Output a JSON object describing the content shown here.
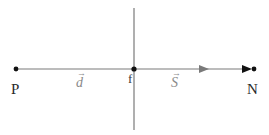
{
  "diagram": {
    "colors": {
      "line": "#7a7a7a",
      "point": "#111111",
      "label_dark": "#2a2a2a",
      "label_vector": "#8a8a8a"
    },
    "points": [
      {
        "id": "P",
        "label": "P",
        "x": 16,
        "y": 69
      },
      {
        "id": "f",
        "label": "f",
        "x": 134,
        "y": 69
      },
      {
        "id": "N",
        "label": "N",
        "x": 253,
        "y": 69
      }
    ],
    "lines": [
      {
        "id": "horizontal-axis",
        "from": [
          16,
          69
        ],
        "to": [
          253,
          69
        ]
      },
      {
        "id": "vertical-axis",
        "from": [
          134,
          8
        ],
        "to": [
          134,
          130
        ]
      }
    ],
    "vectors": [
      {
        "id": "d",
        "symbol": "d",
        "arrow": "→",
        "label_x": 76,
        "label_y": 76
      },
      {
        "id": "S",
        "symbol": "S",
        "arrow": "→",
        "label_x": 171,
        "label_y": 76
      }
    ],
    "arrowheads": [
      {
        "id": "mid-arrow",
        "x": 205,
        "y": 69,
        "direction": "right"
      },
      {
        "id": "end-arrow",
        "x": 250,
        "y": 69,
        "direction": "right"
      }
    ]
  }
}
